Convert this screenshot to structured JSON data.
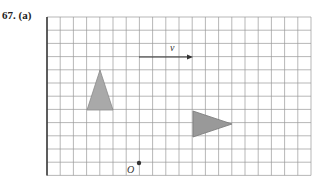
{
  "problem": {
    "number": "67.",
    "part": "(a)"
  },
  "grid": {
    "left": 47,
    "top": 17,
    "cols": 20,
    "rows": 12,
    "cell": 13.2,
    "line_color": "#9a9a9a",
    "border_color": "#333333"
  },
  "vector": {
    "label": "v",
    "x1": 139,
    "y1": 57,
    "x2": 193,
    "y2": 57
  },
  "triangles": [
    {
      "name": "triangle-upright",
      "points": "100,70 87,110 113,110",
      "fill": "#a9a9a9",
      "stroke": "#8a8a8a"
    },
    {
      "name": "triangle-right-pointing",
      "points": "193,111 193,137 232,124",
      "fill": "#999999",
      "stroke": "#7a7a7a"
    }
  ],
  "origin": {
    "label": "O",
    "x": 139,
    "y": 163
  }
}
